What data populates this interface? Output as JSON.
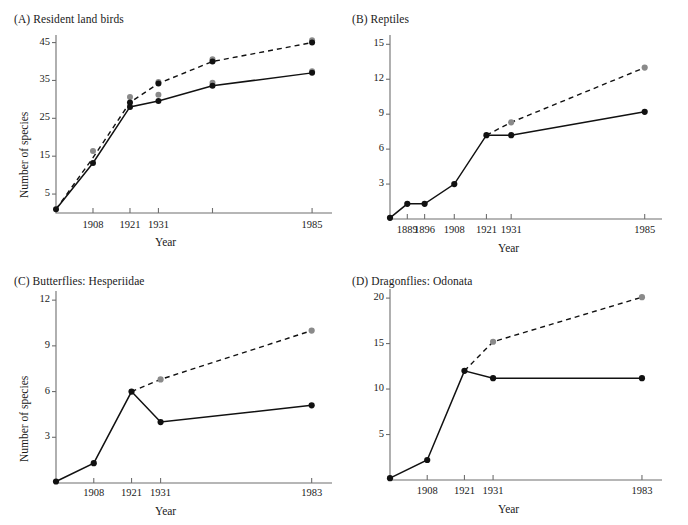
{
  "figure": {
    "axis_color": "#6f6f6f",
    "observed_color": "#111111",
    "estimated_color": "#8a8a8a",
    "background": "#ffffff"
  },
  "chart_data": [
    {
      "type": "line",
      "panel": "A",
      "title": "(A) Resident land birds",
      "xlabel": "Year",
      "ylabel": "Number of species",
      "grid": false,
      "legend": "none",
      "xticks": [
        "1908",
        "1921",
        "1931",
        "",
        "1985"
      ],
      "xtick_values": [
        1908,
        1921,
        1931,
        1950,
        1985
      ],
      "xlim": [
        1895,
        1992
      ],
      "yticks": [
        5,
        15,
        25,
        35,
        45
      ],
      "ylim": [
        0,
        47
      ],
      "series": [
        {
          "name": "observed",
          "style": "solid",
          "marker": "dark",
          "x": [
            1895,
            1908,
            1921,
            1931,
            1950,
            1985
          ],
          "values": [
            1,
            13.2,
            28,
            29.6,
            33.6,
            37
          ]
        },
        {
          "name": "estimated",
          "style": "dashed",
          "marker": "gray",
          "x": [
            1895,
            1908,
            1921,
            1931,
            1950,
            1985
          ],
          "values": [
            1,
            14.6,
            29.2,
            34.2,
            40,
            45
          ]
        }
      ],
      "extra_markers": [
        {
          "x": 1908,
          "y": 16.4,
          "color": "gray"
        },
        {
          "x": 1908,
          "y": 13.2,
          "color": "dark"
        },
        {
          "x": 1921,
          "y": 30.6,
          "color": "gray"
        },
        {
          "x": 1921,
          "y": 29.2,
          "color": "dark"
        },
        {
          "x": 1921,
          "y": 28.0,
          "color": "dark"
        },
        {
          "x": 1931,
          "y": 31.2,
          "color": "gray"
        },
        {
          "x": 1931,
          "y": 29.6,
          "color": "dark"
        },
        {
          "x": 1931,
          "y": 34.6,
          "color": "gray"
        },
        {
          "x": 1931,
          "y": 34.2,
          "color": "dark"
        },
        {
          "x": 1950,
          "y": 40.6,
          "color": "gray"
        },
        {
          "x": 1950,
          "y": 40.0,
          "color": "dark"
        },
        {
          "x": 1950,
          "y": 34.4,
          "color": "gray"
        },
        {
          "x": 1950,
          "y": 33.6,
          "color": "dark"
        },
        {
          "x": 1985,
          "y": 45.6,
          "color": "gray"
        },
        {
          "x": 1985,
          "y": 45.0,
          "color": "dark"
        },
        {
          "x": 1985,
          "y": 37.4,
          "color": "gray"
        },
        {
          "x": 1985,
          "y": 37.0,
          "color": "dark"
        }
      ]
    },
    {
      "type": "line",
      "panel": "B",
      "title": "(B) Reptiles",
      "xlabel": "Year",
      "ylabel": "",
      "grid": false,
      "legend": "none",
      "xticks": [
        "1889",
        "1896",
        "1908",
        "1921",
        "1931",
        "1985"
      ],
      "xtick_values": [
        1889,
        1896,
        1908,
        1921,
        1931,
        1985
      ],
      "xlim": [
        1882,
        1992
      ],
      "yticks": [
        3,
        6,
        9,
        12,
        15
      ],
      "ylim": [
        0,
        15.8
      ],
      "series": [
        {
          "name": "observed",
          "style": "solid",
          "marker": "dark",
          "x": [
            1882,
            1889,
            1896,
            1908,
            1921,
            1931,
            1985
          ],
          "values": [
            0.1,
            1.3,
            1.3,
            3.0,
            7.2,
            7.2,
            9.2
          ]
        },
        {
          "name": "estimated",
          "style": "dashed",
          "marker": "gray",
          "x": [
            1921,
            1931,
            1985
          ],
          "values": [
            7.2,
            8.3,
            13.0
          ]
        }
      ],
      "extra_markers": []
    },
    {
      "type": "line",
      "panel": "C",
      "title": "(C) Butterflies: Hesperiidae",
      "xlabel": "Year",
      "ylabel": "Number of species",
      "grid": false,
      "legend": "none",
      "xticks": [
        "1908",
        "1921",
        "1931",
        "1983"
      ],
      "xtick_values": [
        1908,
        1921,
        1931,
        1983
      ],
      "xlim": [
        1895,
        1990
      ],
      "yticks": [
        3,
        6,
        9,
        12
      ],
      "ylim": [
        0,
        12.6
      ],
      "series": [
        {
          "name": "observed",
          "style": "solid",
          "marker": "dark",
          "x": [
            1895,
            1908,
            1921,
            1931,
            1983
          ],
          "values": [
            0.1,
            1.3,
            6.0,
            4.0,
            5.1
          ]
        },
        {
          "name": "estimated",
          "style": "dashed",
          "marker": "gray",
          "x": [
            1921,
            1931,
            1983
          ],
          "values": [
            6.0,
            6.8,
            10.0
          ]
        }
      ],
      "extra_markers": []
    },
    {
      "type": "line",
      "panel": "D",
      "title": "(D) Dragonflies: Odonata",
      "xlabel": "Year",
      "ylabel": "",
      "grid": false,
      "legend": "none",
      "xticks": [
        "1908",
        "1921",
        "1931",
        "1983"
      ],
      "xtick_values": [
        1908,
        1921,
        1931,
        1983
      ],
      "xlim": [
        1895,
        1990
      ],
      "yticks": [
        5,
        10,
        15,
        20
      ],
      "ylim": [
        0,
        21
      ],
      "series": [
        {
          "name": "observed",
          "style": "solid",
          "marker": "dark",
          "x": [
            1895,
            1908,
            1921,
            1931,
            1983
          ],
          "values": [
            0.2,
            2.2,
            12.0,
            11.2,
            11.2
          ]
        },
        {
          "name": "estimated",
          "style": "dashed",
          "marker": "gray",
          "x": [
            1921,
            1931,
            1983
          ],
          "values": [
            12.0,
            15.2,
            20.1
          ]
        }
      ],
      "extra_markers": []
    }
  ]
}
